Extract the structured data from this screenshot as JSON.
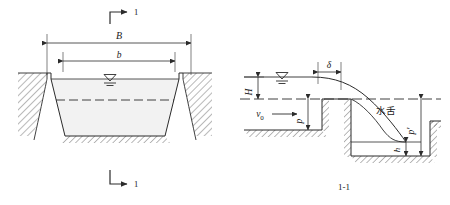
{
  "figure": {
    "type": "engineering-diagram",
    "line_color": "#2b2b2b",
    "fill_color": "#f2f2f2",
    "background": "#ffffff"
  },
  "left_view": {
    "name": "trapezoidal canal cross section",
    "section_marker_top": "1",
    "section_marker_bottom": "1",
    "dim_top_width": "B",
    "dim_inner_width": "b",
    "water_level_symbol": "▽"
  },
  "right_view": {
    "name": "weir profile",
    "caption": "1-1",
    "head_label": "H",
    "crest_thickness_label": "δ",
    "approach_velocity_label": "v",
    "approach_velocity_sub": "0",
    "upstream_depth_label": "p",
    "downstream_depth_label": "p",
    "downstream_depth_prime": "′",
    "tailwater_label": "h",
    "nappe_label": "水舌",
    "water_level_symbol": "▽"
  }
}
